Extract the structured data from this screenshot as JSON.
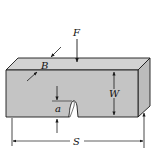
{
  "diagram": {
    "colors": {
      "specimen_fill": "#c4c4c4",
      "specimen_top": "#d2d2d2",
      "specimen_side": "#bcbcbc",
      "line": "#1a1a1a",
      "background": "#ffffff"
    },
    "labels": {
      "force": "F",
      "thickness": "B",
      "width": "W",
      "crack_length": "a",
      "span": "S"
    }
  }
}
